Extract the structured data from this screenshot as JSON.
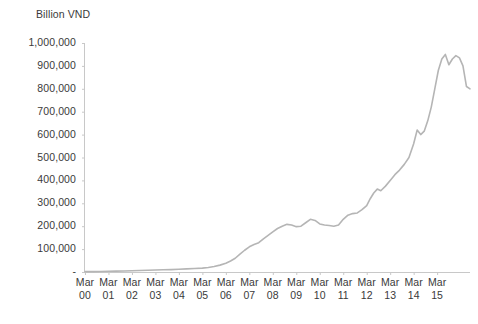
{
  "chart_data": {
    "type": "line",
    "title": "",
    "ylabel": "Billion VND",
    "xlabel": "",
    "ylim": [
      0,
      1000000
    ],
    "ytick_labels": [
      "1,000,000",
      "900,000",
      "800,000",
      "700,000",
      "600,000",
      "500,000",
      "400,000",
      "300,000",
      "200,000",
      "100,000",
      "-"
    ],
    "ytick_values": [
      1000000,
      900000,
      800000,
      700000,
      600000,
      500000,
      400000,
      300000,
      200000,
      100000,
      0
    ],
    "categories": [
      "Mar 00",
      "Mar 01",
      "Mar 02",
      "Mar 03",
      "Mar 04",
      "Mar 05",
      "Mar 06",
      "Mar 07",
      "Mar 08",
      "Mar 09",
      "Mar 10",
      "Mar 11",
      "Mar 12",
      "Mar 13",
      "Mar 14",
      "Mar 15"
    ],
    "xtick_labels": [
      {
        "month": "Mar",
        "year": "00"
      },
      {
        "month": "Mar",
        "year": "01"
      },
      {
        "month": "Mar",
        "year": "02"
      },
      {
        "month": "Mar",
        "year": "03"
      },
      {
        "month": "Mar",
        "year": "04"
      },
      {
        "month": "Mar",
        "year": "05"
      },
      {
        "month": "Mar",
        "year": "06"
      },
      {
        "month": "Mar",
        "year": "07"
      },
      {
        "month": "Mar",
        "year": "08"
      },
      {
        "month": "Mar",
        "year": "09"
      },
      {
        "month": "Mar",
        "year": "10"
      },
      {
        "month": "Mar",
        "year": "11"
      },
      {
        "month": "Mar",
        "year": "12"
      },
      {
        "month": "Mar",
        "year": "13"
      },
      {
        "month": "Mar",
        "year": "14"
      },
      {
        "month": "Mar",
        "year": "15"
      }
    ],
    "grid": false,
    "legend": "none",
    "line_color": "#b5b5b5",
    "axis_color": "#c8c8c8",
    "series": [
      {
        "name": "Market capitalisation",
        "x": [
          0.0,
          0.33,
          0.67,
          1.0,
          1.33,
          1.67,
          2.0,
          2.33,
          2.67,
          3.0,
          3.33,
          3.67,
          4.0,
          4.33,
          4.67,
          5.0,
          5.25,
          5.5,
          5.75,
          6.0,
          6.2,
          6.4,
          6.6,
          6.8,
          7.0,
          7.2,
          7.4,
          7.6,
          7.8,
          8.0,
          8.2,
          8.4,
          8.6,
          8.8,
          9.0,
          9.2,
          9.4,
          9.6,
          9.8,
          10.0,
          10.2,
          10.4,
          10.6,
          10.8,
          11.0,
          11.2,
          11.4,
          11.6,
          11.8,
          12.0,
          12.15,
          12.3,
          12.45,
          12.6,
          12.8,
          13.0,
          13.2,
          13.4,
          13.6,
          13.8,
          14.0,
          14.15,
          14.3,
          14.45,
          14.6,
          14.75,
          14.9,
          15.05,
          15.2,
          15.35,
          15.5
        ],
        "values": [
          1500,
          1800,
          2500,
          3500,
          4000,
          4500,
          5500,
          6500,
          7500,
          8500,
          9500,
          10500,
          12000,
          13500,
          15000,
          17000,
          20000,
          24000,
          30000,
          38000,
          48000,
          60000,
          78000,
          95000,
          110000,
          120000,
          128000,
          145000,
          160000,
          175000,
          190000,
          200000,
          208000,
          205000,
          198000,
          200000,
          215000,
          230000,
          225000,
          210000,
          205000,
          203000,
          200000,
          205000,
          230000,
          248000,
          255000,
          258000,
          272000,
          290000,
          320000,
          345000,
          362000,
          355000,
          375000,
          400000,
          425000,
          445000,
          470000,
          500000,
          560000,
          620000,
          600000,
          615000,
          660000,
          720000,
          800000,
          880000,
          930000,
          950000,
          905000
        ],
        "tail_x": [
          15.5,
          15.65,
          15.8,
          15.95,
          16.1,
          16.25,
          16.4
        ],
        "tail_values": [
          905000,
          930000,
          945000,
          935000,
          900000,
          810000,
          800000
        ]
      }
    ],
    "data_points_note": "Quarterly series, Mar 2000 - mid 2016, values in Billion VND",
    "peak_value": 950000,
    "end_value": 800000
  }
}
